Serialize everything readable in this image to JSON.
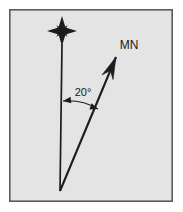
{
  "figure": {
    "name": "magnetic-declination-diagram",
    "background_color": "#e4e4e4",
    "page_color": "#ffffff",
    "border_color": "#5b5b5b",
    "ink_color": "#1d1d1d"
  },
  "frame": {
    "left": 9,
    "top": 9,
    "right": 173,
    "bottom": 202,
    "border_width": 1.6
  },
  "true_north": {
    "star_icon": "compass-star-icon",
    "points": 8,
    "center_x": 62,
    "center_y": 31,
    "long_radius": 15,
    "short_radius": 8,
    "waist": 2.6
  },
  "true_north_line": {
    "x1": 62,
    "y1": 44,
    "x2": 60,
    "y2": 191,
    "width": 1.7
  },
  "magnetic_north_arrow": {
    "label": "MN",
    "label_x": 129,
    "label_y": 49,
    "label_size": 12,
    "tail_x": 60,
    "tail_y": 191,
    "tip_x": 116,
    "tip_y": 57,
    "shaft_width": 2.1,
    "head_length": 22,
    "head_half_width": 6
  },
  "angle_annotation": {
    "label": "20°",
    "label_x": 83,
    "label_y": 96,
    "label_size": 11,
    "arc_start_x": 63,
    "arc_start_y": 101,
    "arc_end_x": 98,
    "arc_end_y": 109,
    "arc_radius": 58,
    "arrow_size": 4.2,
    "line_width": 1.1
  }
}
